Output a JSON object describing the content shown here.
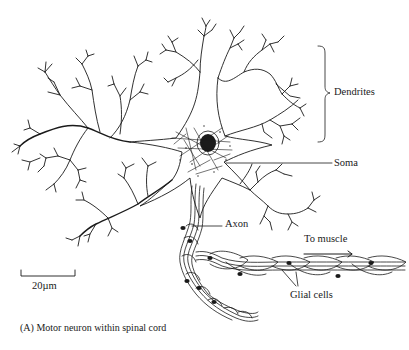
{
  "figure": {
    "caption": "(A) Motor neuron within spinal cord",
    "subject": "Motor neuron",
    "labels": {
      "dendrites": "Dendrites",
      "soma": "Soma",
      "axon": "Axon",
      "to_muscle": "To muscle",
      "glial_cells": "Glial cells"
    },
    "scale_bar": {
      "label": "20µm",
      "length_px": 54
    },
    "colors": {
      "ink": "#1a1a1a",
      "background": "#ffffff"
    }
  }
}
